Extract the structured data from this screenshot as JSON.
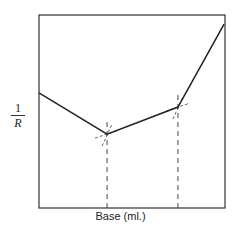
{
  "chart_data": {
    "type": "line",
    "title": "",
    "xlabel": "Base (ml.)",
    "ylabel": {
      "numerator": "1",
      "denominator": "R"
    },
    "xlim": [
      0,
      10
    ],
    "ylim": [
      0,
      10
    ],
    "grid": false,
    "legend": null,
    "series": [
      {
        "name": "conductance",
        "x": [
          0,
          3.66,
          7.47,
          9.95
        ],
        "y": [
          5.96,
          3.83,
          5.23,
          9.53
        ]
      }
    ],
    "equivalence_points": [
      {
        "x": 3.66,
        "y": 3.83
      },
      {
        "x": 7.47,
        "y": 5.23
      }
    ]
  }
}
